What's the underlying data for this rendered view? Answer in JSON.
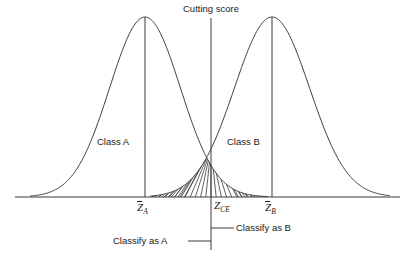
{
  "figure": {
    "type": "statistical-diagram"
  },
  "labels": {
    "cutting_score": "Cutting score",
    "class_a": "Class A",
    "class_b": "Class B",
    "classify_as_a": "Classify as A",
    "classify_as_b": "Classify as B"
  },
  "axis_marks": {
    "mean_a": {
      "symbol": "Z",
      "overbar": true,
      "subscript": "A"
    },
    "cut": {
      "symbol": "Z",
      "overbar": false,
      "subscript": "CE"
    },
    "mean_b": {
      "symbol": "Z",
      "overbar": true,
      "subscript": "B"
    }
  },
  "colors": {
    "line": "#3a3a3a",
    "text": "#1a1a1a",
    "hatch": "#3a3a3a",
    "background": "#ffffff"
  },
  "chart_data": {
    "type": "line",
    "title": "",
    "xlabel": "",
    "ylabel": "",
    "grid": false,
    "legend": "none",
    "xlim": [
      0,
      413
    ],
    "ylim": [
      0,
      260
    ],
    "baseline_y": 197,
    "baseline_x_range": [
      15,
      400
    ],
    "series": [
      {
        "name": "Class A",
        "distribution": "normal",
        "mean_px": 145,
        "peak_y_px": 17,
        "tail_left_px": 30,
        "tail_right_px": 268,
        "mean_label": "Z̄A"
      },
      {
        "name": "Class B",
        "distribution": "normal",
        "mean_px": 272,
        "peak_y_px": 17,
        "tail_left_px": 150,
        "tail_right_px": 390,
        "mean_label": "Z̄B"
      }
    ],
    "cutting_score": {
      "label": "Cutting score",
      "x_px": 211,
      "line_top_px": 18,
      "line_bottom_px": 250,
      "intersection_y_px": 148,
      "axis_label": "ZCE"
    },
    "hatched_region": {
      "description": "Overlap / misclassification area between the two curves below their intersection point",
      "apex_x_px": 211,
      "apex_y_px": 148,
      "left_extent_px": 152,
      "right_extent_px": 272,
      "line_count": 30
    },
    "annotations": [
      {
        "text": "Classify as A",
        "side": "left",
        "leader_from_x_px": 211,
        "leader_y_px": 241
      },
      {
        "text": "Classify as B",
        "side": "right",
        "leader_from_x_px": 211,
        "leader_y_px": 228
      }
    ]
  }
}
